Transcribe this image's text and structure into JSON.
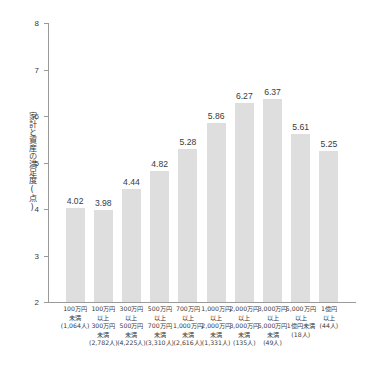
{
  "chart_data": {
    "type": "bar",
    "title": "",
    "subtitle": "",
    "xlabel": "",
    "ylabel": "家計と資産の満足度(点)",
    "ylim": [
      2,
      8
    ],
    "ytick_labels": [
      "8",
      "7",
      "6",
      "5",
      "4",
      "3",
      "2"
    ],
    "ytick_values": [
      8,
      7,
      6,
      5,
      4,
      3,
      2
    ],
    "grid": false,
    "legend": null,
    "categories": [
      "100万円未満 (1,064人)",
      "100万円以上 300万円未満 (2,782人)",
      "300万円以上 500万円未満 (4,225人)",
      "500万円以上 700万円未満 (3,310人)",
      "700万円以上 1,000万円未満 (2,616人)",
      "1,000万円以上 2,000万円未満 (1,331人)",
      "2,000万円以上 3,000万円未満 (135人)",
      "3,000万円以上 5,000万円未満 (49人)",
      "5,000万円以上 1億円未満 (18人)",
      "1億円以上 (44人)"
    ],
    "category_lines": [
      [
        "100万円",
        "未満",
        "(1,064人)"
      ],
      [
        "100万円",
        "以上",
        "300万円",
        "未満",
        "(2,782人)"
      ],
      [
        "300万円",
        "以上",
        "500万円",
        "未満",
        "(4,225人)"
      ],
      [
        "500万円",
        "以上",
        "700万円",
        "未満",
        "(3,310人)"
      ],
      [
        "700万円",
        "以上",
        "1,000万円",
        "未満",
        "(2,616人)"
      ],
      [
        "1,000万円",
        "以上",
        "2,000万円",
        "未満",
        "(1,331人)"
      ],
      [
        "2,000万円",
        "以上",
        "3,000万円",
        "未満",
        "(135人)"
      ],
      [
        "3,000万円",
        "以上",
        "5,000万円",
        "未満",
        "(49人)"
      ],
      [
        "5,000万円",
        "以上",
        "1億円未満",
        "(18人)"
      ],
      [
        "1億円",
        "以上",
        "(44人)"
      ]
    ],
    "values": [
      4.02,
      3.98,
      4.44,
      4.82,
      5.28,
      5.86,
      6.27,
      6.37,
      5.61,
      5.25
    ],
    "value_labels": [
      "4.02",
      "3.98",
      "4.44",
      "4.82",
      "5.28",
      "5.86",
      "6.27",
      "6.37",
      "5.61",
      "5.25"
    ],
    "colors": {
      "bar_fill": "#dedede",
      "axis": "#9a9a9a",
      "text": "#3a3a3a",
      "background": "#ffffff"
    }
  }
}
